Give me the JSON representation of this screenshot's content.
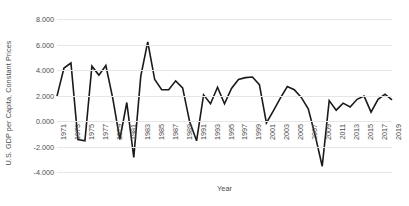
{
  "chart_data": {
    "type": "line",
    "title": "",
    "xlabel": "Year",
    "ylabel": "U.S. GDP per Capita, Constant Prices",
    "ylim": [
      -4.0,
      8.0
    ],
    "ytick_step": 2.0,
    "ytick_labels": [
      "8.000",
      "6.000",
      "4.000",
      "2.000",
      "0.000",
      "-2.000",
      "-4.000"
    ],
    "ytick_values": [
      8.0,
      6.0,
      4.0,
      2.0,
      0.0,
      -2.0,
      -4.0
    ],
    "xtick_labels": [
      "1971",
      "1973",
      "1975",
      "1977",
      "1979",
      "1981",
      "1983",
      "1985",
      "1987",
      "1989",
      "1991",
      "1993",
      "1995",
      "1997",
      "1999",
      "2001",
      "2003",
      "2005",
      "2007",
      "2009",
      "2011",
      "2013",
      "2015",
      "2017",
      "2019"
    ],
    "xlim": [
      1971,
      2019
    ],
    "grid": "horizontal",
    "legend": "none",
    "line_color": "#1a1a1a",
    "line_width": 1.6,
    "x": [
      1971,
      1972,
      1973,
      1974,
      1975,
      1976,
      1977,
      1978,
      1979,
      1980,
      1981,
      1982,
      1983,
      1984,
      1985,
      1986,
      1987,
      1988,
      1989,
      1990,
      1991,
      1992,
      1993,
      1994,
      1995,
      1996,
      1997,
      1998,
      1999,
      2000,
      2001,
      2002,
      2003,
      2004,
      2005,
      2006,
      2007,
      2008,
      2009,
      2010,
      2011,
      2012,
      2013,
      2014,
      2015,
      2016,
      2017,
      2018,
      2019
    ],
    "values": [
      1.95,
      4.15,
      4.55,
      -1.45,
      -1.55,
      4.3,
      3.6,
      4.35,
      1.75,
      -1.45,
      1.45,
      -2.85,
      3.5,
      6.2,
      3.25,
      2.45,
      2.45,
      3.15,
      2.6,
      -0.05,
      -1.55,
      2.05,
      1.35,
      2.65,
      1.35,
      2.55,
      3.25,
      3.4,
      3.45,
      2.85,
      -0.15,
      0.8,
      1.8,
      2.7,
      2.45,
      1.85,
      0.95,
      -1.15,
      -3.55,
      1.6,
      0.85,
      1.4,
      1.1,
      1.7,
      1.95,
      0.7,
      1.7,
      2.1,
      1.65
    ]
  }
}
